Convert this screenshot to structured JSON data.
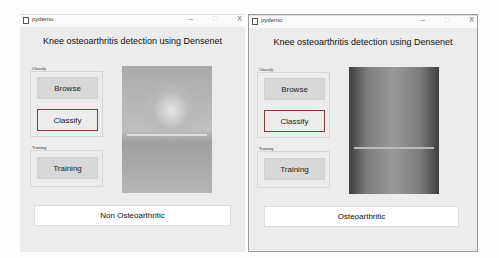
{
  "windows": [
    {
      "title": "pydemo",
      "controls": {
        "minimize": "–",
        "maximize": "□",
        "close": "X"
      },
      "app_title": "Knee osteoarthritis detection using Densenet",
      "classify_frame": {
        "label": "Classify",
        "browse": "Browse",
        "classify": "Classify"
      },
      "training_frame": {
        "label": "Training",
        "training": "Training"
      },
      "image": "knee x-ray (normal)",
      "result": "Non Osteoarthritic"
    },
    {
      "title": "pydemo",
      "controls": {
        "minimize": "–",
        "maximize": "□",
        "close": "X"
      },
      "app_title": "Knee osteoarthritis detection using Densenet",
      "classify_frame": {
        "label": "Classify",
        "browse": "Browse",
        "classify": "Classify"
      },
      "training_frame": {
        "label": "Training",
        "training": "Training"
      },
      "image": "knee x-ray (osteoarthritic)",
      "result": "Osteoarthritic"
    }
  ]
}
